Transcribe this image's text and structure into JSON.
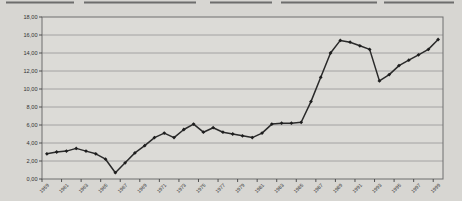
{
  "colors": {
    "page_bg": "#d7d6d2",
    "plot_bg": "#dcdbd7",
    "frame": "#6e6e6e",
    "gridline": "#9c9c9c",
    "axis": "#444444",
    "tick_label": "#333333",
    "series_line": "#2a2a2a",
    "marker": "#1e1e1e",
    "scan_artifact": "#4a4a4a"
  },
  "artifacts": {
    "top_scan_line": true
  },
  "chart_data": {
    "type": "line",
    "title": "",
    "xlabel": "",
    "ylabel": "",
    "legend": "none",
    "grid": "horizontal",
    "ylim": [
      0,
      18
    ],
    "y_step": 2,
    "decimal_separator": ",",
    "marker": "diamond",
    "categories": [
      "1959",
      "1960",
      "1961",
      "1962",
      "1963",
      "1964",
      "1965",
      "1966",
      "1967",
      "1968",
      "1969",
      "1970",
      "1971",
      "1972",
      "1973",
      "1974",
      "1975",
      "1976",
      "1977",
      "1978",
      "1979",
      "1980",
      "1981",
      "1982",
      "1983",
      "1984",
      "1985",
      "1986",
      "1987",
      "1988",
      "1989",
      "1990",
      "1991",
      "1992",
      "1993",
      "1994",
      "1995",
      "1996",
      "1997",
      "1998",
      "1999"
    ],
    "values": [
      2.8,
      3.0,
      3.1,
      3.4,
      3.1,
      2.8,
      2.2,
      0.7,
      1.8,
      2.9,
      3.7,
      4.6,
      5.1,
      4.6,
      5.5,
      6.1,
      5.2,
      5.7,
      5.2,
      5.0,
      4.8,
      4.6,
      5.1,
      6.1,
      6.2,
      6.2,
      6.3,
      8.6,
      11.3,
      14.0,
      15.4,
      15.2,
      14.8,
      14.4,
      10.9,
      11.6,
      12.6,
      13.2,
      13.8,
      14.4,
      15.5
    ],
    "x_tick_labels": [
      "1959",
      "1961",
      "1963",
      "1965",
      "1967",
      "1969",
      "1971",
      "1973",
      "1975",
      "1977",
      "1979",
      "1981",
      "1983",
      "1985",
      "1987",
      "1989",
      "1991",
      "1993",
      "1995",
      "1997",
      "1999"
    ],
    "y_tick_labels": [
      "18,00",
      "16,00",
      "14,00",
      "12,00",
      "10,00",
      "8,00",
      "6,00",
      "4,00",
      "2,00",
      "0,00"
    ]
  }
}
